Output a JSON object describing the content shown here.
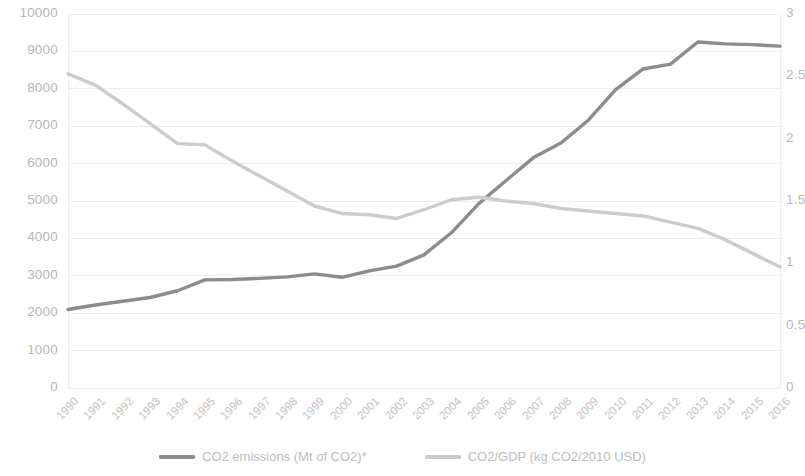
{
  "chart_data": {
    "type": "line",
    "title": "",
    "xlabel": "",
    "categories": [
      "1990",
      "1991",
      "1992",
      "1993",
      "1994",
      "1995",
      "1996",
      "1997",
      "1998",
      "1999",
      "2000",
      "2001",
      "2002",
      "2003",
      "2004",
      "2005",
      "2006",
      "2007",
      "2008",
      "2009",
      "2010",
      "2011",
      "2012",
      "2013",
      "2014",
      "2015",
      "2016"
    ],
    "grid": true,
    "legend_position": "bottom",
    "axes": {
      "left": {
        "label": "CO2 emissions (Mt of CO2)",
        "min": 0,
        "max": 10000,
        "step": 1000,
        "ticks": [
          "0",
          "1000",
          "2000",
          "3000",
          "4000",
          "5000",
          "6000",
          "7000",
          "8000",
          "9000",
          "10000"
        ]
      },
      "right": {
        "label": "CO2/GDP (kg CO2/2010 USD)",
        "min": 0,
        "max": 3,
        "step": 0.5,
        "ticks": [
          "0",
          "0.5",
          "1",
          "1.5",
          "2",
          "2.5",
          "3"
        ]
      }
    },
    "series": [
      {
        "name": "CO2 emissions (Mt of CO2)*",
        "axis": "left",
        "color": "#8c8c8c",
        "values": [
          2100,
          2220,
          2320,
          2420,
          2600,
          2890,
          2900,
          2930,
          2970,
          3050,
          2960,
          3130,
          3260,
          3560,
          4150,
          4930,
          5550,
          6160,
          6550,
          7160,
          7980,
          8530,
          8660,
          9250,
          9200,
          9180,
          9140
        ]
      },
      {
        "name": "CO2/GDP (kg CO2/2010 USD)",
        "axis": "right",
        "color": "#cccccc",
        "values": [
          2.52,
          2.43,
          2.28,
          2.12,
          1.96,
          1.95,
          1.82,
          1.7,
          1.58,
          1.46,
          1.4,
          1.39,
          1.36,
          1.43,
          1.51,
          1.53,
          1.5,
          1.48,
          1.44,
          1.42,
          1.4,
          1.38,
          1.33,
          1.28,
          1.19,
          1.08,
          0.97
        ]
      }
    ]
  },
  "legend": {
    "items": [
      {
        "label": "CO2 emissions (Mt of CO2)*",
        "color": "#8c8c8c"
      },
      {
        "label": "CO2/GDP (kg CO2/2010 USD)",
        "color": "#cccccc"
      }
    ]
  },
  "colors": {
    "series_primary": "#8c8c8c",
    "series_secondary": "#cccccc",
    "gridline": "#ededed",
    "tick_text": "#bebebe",
    "background": "#ffffff"
  }
}
